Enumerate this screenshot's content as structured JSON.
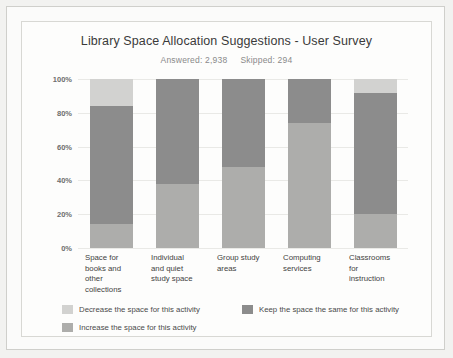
{
  "chart_data": {
    "type": "bar",
    "stacked": true,
    "orientation": "vertical",
    "title": "Library Space Allocation Suggestions - User Survey",
    "subtitle_answered_label": "Answered: 2,938",
    "subtitle_skipped_label": "Skipped: 294",
    "answered": 2938,
    "skipped": 294,
    "xlabel": "",
    "ylabel": "",
    "ylim": [
      0,
      100
    ],
    "ytick_labels": [
      "0%",
      "20%",
      "40%",
      "60%",
      "80%",
      "100%"
    ],
    "ytick_values": [
      0,
      20,
      40,
      60,
      80,
      100
    ],
    "grid": true,
    "legend_position": "bottom-left",
    "categories": [
      "Space for books and other collections",
      "Individual and quiet study space",
      "Group study areas",
      "Computing services",
      "Classrooms for instruction"
    ],
    "category_lines": [
      [
        "Space for",
        "books and",
        "other",
        "collections"
      ],
      [
        "Individual",
        "and quiet",
        "study space"
      ],
      [
        "Group study",
        "areas"
      ],
      [
        "Computing",
        "services"
      ],
      [
        "Classrooms",
        "for",
        "instruction"
      ]
    ],
    "series": [
      {
        "name": "Decrease the space for this activity",
        "color": "#d2d2d0",
        "values": [
          16,
          0,
          0,
          0,
          8
        ]
      },
      {
        "name": "Keep the space the same for this activity",
        "color": "#8c8c8c",
        "values": [
          70,
          62,
          52,
          26,
          72
        ]
      },
      {
        "name": "Increase the space for this activity",
        "color": "#adadab",
        "values": [
          14,
          38,
          48,
          74,
          20
        ]
      }
    ],
    "stack_order_top_to_bottom": [
      "Decrease the space for this activity",
      "Keep the space the same for this activity",
      "Increase the space for this activity"
    ]
  },
  "legend": {
    "items": [
      {
        "label": "Decrease the space for this activity",
        "color": "#d2d2d0"
      },
      {
        "label": "Keep the space the same for this activity",
        "color": "#8c8c8c"
      },
      {
        "label": "Increase the space for this activity",
        "color": "#adadab"
      }
    ]
  }
}
